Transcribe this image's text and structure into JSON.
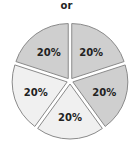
{
  "title": "or",
  "chart_data": {
    "type": "pie",
    "title": "or",
    "exploded": true,
    "categories": [
      "Slice 1",
      "Slice 2",
      "Slice 3",
      "Slice 4",
      "Slice 5"
    ],
    "values": [
      20,
      20,
      20,
      20,
      20
    ],
    "labels": [
      "20%",
      "20%",
      "20%",
      "20%",
      "20%"
    ],
    "slice_colors": [
      "#cfcfcf",
      "#cfcfcf",
      "#f0f0f0",
      "#f0f0f0",
      "#cfcfcf"
    ],
    "border_color": "#8a8a8a"
  }
}
